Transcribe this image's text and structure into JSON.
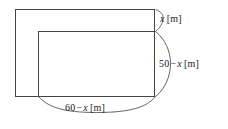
{
  "figure": {
    "type": "geometry-diagram",
    "stroke_color": "#444444",
    "brace_color": "#555555",
    "background_color": "#ffffff",
    "outer_rectangle": {
      "name": "outer-rectangle",
      "x": 15,
      "y": 9,
      "width": 140,
      "height": 88
    },
    "inner_rectangle": {
      "name": "inner-rectangle",
      "x": 38,
      "y": 31,
      "width": 117,
      "height": 66
    }
  },
  "labels": {
    "top_right": {
      "name": "x-dimension-label",
      "value": "x",
      "unit": "[m]",
      "full_text": "x [m]"
    },
    "right": {
      "name": "height-dimension-label",
      "value_left": "50",
      "operator": "−",
      "value_right": "x",
      "unit": "[m]",
      "full_text": "50 − x [m]"
    },
    "bottom": {
      "name": "width-dimension-label",
      "value_left": "60",
      "operator": "−",
      "value_right": "x",
      "unit": "[m]",
      "full_text": "60 − x [m]"
    }
  }
}
